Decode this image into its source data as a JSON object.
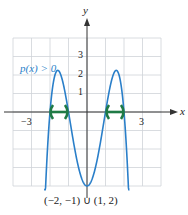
{
  "chart_data": {
    "type": "line",
    "title": "",
    "function": "p(x) = -(x^2 - 1)(x^2 - 4)",
    "xlabel": "x",
    "ylabel": "y",
    "xlim": [
      -4,
      4
    ],
    "ylim": [
      -4,
      4
    ],
    "grid": true,
    "x_tick_labels": [
      "-3",
      "3"
    ],
    "y_tick_labels": [
      "1",
      "2",
      "3"
    ],
    "annotation": "p(x) > 0",
    "solution_label": "(−2, −1) ∪ (1, 2)",
    "intervals": [
      [
        -2,
        -1
      ],
      [
        1,
        2
      ]
    ],
    "series": [
      {
        "name": "p(x)",
        "color": "#2a7fc9",
        "x": [
          -2.3,
          -2,
          -1.58,
          -1,
          -0.5,
          0,
          0.5,
          1,
          1.58,
          2,
          2.3
        ],
        "y": [
          -4,
          0,
          2.25,
          0,
          -2.81,
          -4,
          -2.81,
          0,
          2.25,
          0,
          -4
        ]
      }
    ]
  },
  "labels": {
    "y_axis": "y",
    "x_axis": "x",
    "xm3": "−3",
    "x3": "3",
    "y1": "1",
    "y2": "2",
    "y3": "3",
    "annotation": "p(x) > 0",
    "solution": "(−2, −1) ∪ (1, 2)"
  },
  "colors": {
    "curve": "#2a7fc9",
    "interval": "#1f7a45",
    "grid": "#cfd3d8",
    "axis": "#333333"
  }
}
